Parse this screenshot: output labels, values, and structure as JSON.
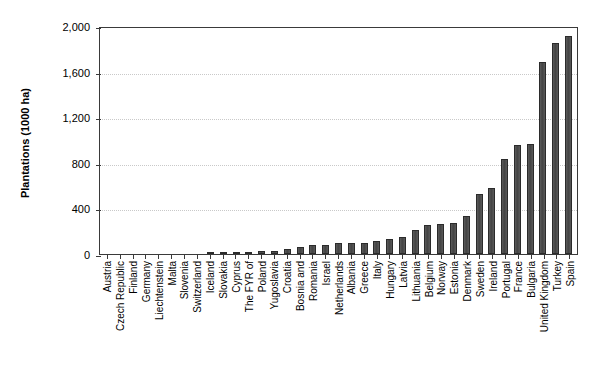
{
  "chart_data": {
    "type": "bar",
    "title": "",
    "xlabel": "",
    "ylabel": "Plantations (1000 ha)",
    "ylim": [
      0,
      2000
    ],
    "yticks": [
      0,
      400,
      800,
      1200,
      1600,
      2000
    ],
    "ytick_labels": [
      "0",
      "400",
      "800",
      "1,200",
      "1,600",
      "2,000"
    ],
    "grid": "horizontal-dotted",
    "legend": "none",
    "bar_color": "#4e4e4e",
    "bar_edge_color": "#2b2b2b",
    "categories": [
      "Austria",
      "Czech Republic",
      "Finland",
      "Germany",
      "Liechtenstein",
      "Malta",
      "Slovenia",
      "Switzerland",
      "Iceland",
      "Slovakia",
      "Cyprus",
      "The FYR of",
      "Poland",
      "Yugoslavia",
      "Croatia",
      "Bosnia and",
      "Romania",
      "Israel",
      "Netherlands",
      "Albania",
      "Greece",
      "Italy",
      "Hungary",
      "Latvia",
      "Lithuania",
      "Belgium",
      "Norway",
      "Estonia",
      "Denmark",
      "Sweden",
      "Ireland",
      "Portugal",
      "France",
      "Bulgaria",
      "United Kingdom",
      "Turkey",
      "Spain"
    ],
    "values": [
      0,
      0,
      0,
      0,
      0,
      0,
      0,
      0,
      8,
      13,
      17,
      22,
      26,
      30,
      45,
      60,
      78,
      80,
      95,
      97,
      100,
      110,
      128,
      150,
      215,
      255,
      265,
      270,
      330,
      530,
      575,
      830,
      960,
      965,
      1680,
      1855,
      1910
    ]
  }
}
